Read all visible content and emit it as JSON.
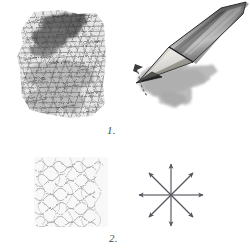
{
  "figure": {
    "background_color": "#ffffff",
    "width": 250,
    "height": 252,
    "medium": "graphite pencil drawing"
  },
  "labels": {
    "step_one": "1.",
    "step_two": "2."
  },
  "panels": [
    {
      "id": "panel-1a",
      "name": "dense-hatch-patch",
      "description": "Dark irregular rectangular patch of dense overlapping graphite hatching, heaviest at the upper area",
      "bounds": {
        "x": 20,
        "y": 10,
        "width": 86,
        "height": 108
      },
      "tone": "dark",
      "ink_color": "#3a3a3a"
    },
    {
      "id": "panel-1b",
      "name": "pencil-and-stroke",
      "description": "Sharpened graphite pencil drawn in perspective pointing down-left, laying a broad smudged stroke; a small curved dashed rotation arrow marks the tip pivot",
      "bounds": {
        "x": 128,
        "y": 5,
        "width": 118,
        "height": 105
      },
      "pencil": {
        "body_color": "#8d8d8d",
        "body_shadow": "#4b4b4b",
        "wood_color": "#d8d5cf",
        "tip_color": "#2b2b2b",
        "outline_color": "#2f2f2f"
      },
      "stroke_mark": {
        "name": "graphite-smudge-stroke",
        "color": "#a0a0a0"
      },
      "rotation_arrow": {
        "name": "pivot-dashed-arrow",
        "style": "dashed curve with arrowhead",
        "color": "#555555"
      }
    },
    {
      "id": "panel-2a",
      "name": "light-scribble-patch",
      "description": "Loose, light squiggly scribble fill forming a soft square patch",
      "bounds": {
        "x": 35,
        "y": 158,
        "width": 72,
        "height": 68
      },
      "tone": "light",
      "ink_color": "#9a9a9a"
    },
    {
      "id": "panel-2b",
      "name": "eight-direction-arrow-star",
      "description": "Eight arrows radiating from a common center point in all compass directions, indicating multi-directional stroke movement",
      "bounds": {
        "x": 138,
        "y": 162,
        "width": 66,
        "height": 66
      },
      "center": {
        "x": 171,
        "y": 195
      },
      "radius": 32,
      "arrow_count": 8,
      "directions": [
        "up",
        "up-right",
        "right",
        "down-right",
        "down",
        "down-left",
        "left",
        "up-left"
      ],
      "ink_color": "#55555f"
    }
  ]
}
